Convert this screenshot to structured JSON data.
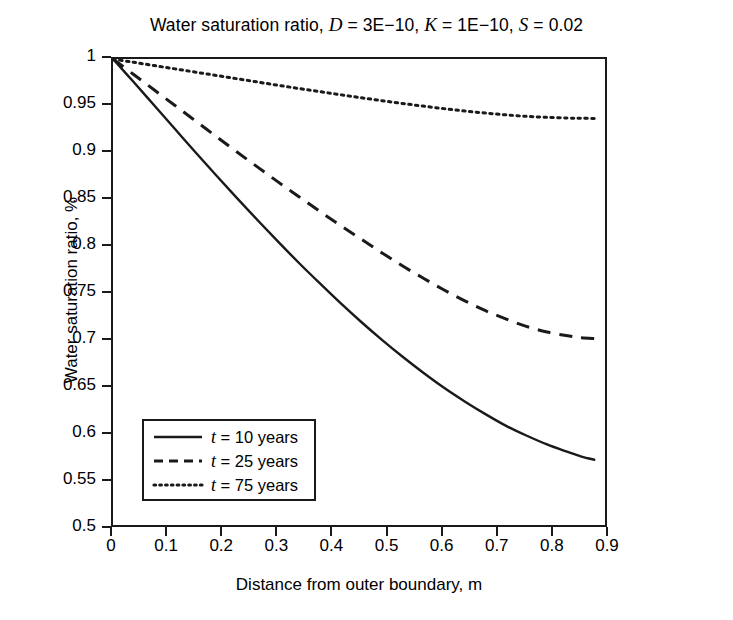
{
  "chart_data": {
    "type": "line",
    "title": "Water saturation ratio, D = 3E−10, K = 1E−10, S = 0.02",
    "title_parts": {
      "prefix": "Water saturation ratio, ",
      "d_symbol": "D",
      "d_value": " = 3E−10, ",
      "k_symbol": "K",
      "k_value": " = 1E−10, ",
      "s_symbol": "S",
      "s_value": " = 0.02"
    },
    "xlabel": "Distance from outer boundary, m",
    "ylabel": "Water saturation ratio, %",
    "xlim": [
      0,
      0.9
    ],
    "ylim": [
      0.5,
      1
    ],
    "grid": false,
    "legend_position": "lower-left-inside",
    "xticks": [
      0,
      0.1,
      0.2,
      0.3,
      0.4,
      0.5,
      0.6,
      0.7,
      0.8,
      0.9
    ],
    "xticklabels": [
      "0",
      "0.1",
      "0.2",
      "0.3",
      "0.4",
      "0.5",
      "0.6",
      "0.7",
      "0.8",
      "0.9"
    ],
    "yticks": [
      0.5,
      0.55,
      0.6,
      0.65,
      0.7,
      0.75,
      0.8,
      0.85,
      0.9,
      0.95,
      1
    ],
    "yticklabels": [
      "0.5",
      "0.55",
      "0.6",
      "0.65",
      "0.7",
      "0.75",
      "0.8",
      "0.85",
      "0.9",
      "0.95",
      "1"
    ],
    "x": [
      0,
      0.0375,
      0.075,
      0.1125,
      0.15,
      0.1875,
      0.225,
      0.2625,
      0.3,
      0.3375,
      0.375,
      0.4125,
      0.45,
      0.4875,
      0.525,
      0.5625,
      0.6,
      0.6375,
      0.675,
      0.7125,
      0.75,
      0.7875,
      0.825,
      0.85,
      0.875
    ],
    "series": [
      {
        "name": "t = 10 years",
        "label_symbol": "t",
        "label_rest": " = 10 years",
        "linestyle": "solid",
        "color": "#1a1a1a",
        "values": [
          1,
          0.9755,
          0.9505,
          0.9255,
          0.9005,
          0.876,
          0.852,
          0.8285,
          0.8055,
          0.783,
          0.7615,
          0.7405,
          0.7205,
          0.7015,
          0.6835,
          0.6665,
          0.6505,
          0.636,
          0.6225,
          0.61,
          0.5995,
          0.59,
          0.582,
          0.577,
          0.5735
        ]
      },
      {
        "name": "t = 25 years",
        "label_symbol": "t",
        "label_rest": " = 25 years",
        "linestyle": "dashed",
        "color": "#1a1a1a",
        "values": [
          1,
          0.9835,
          0.967,
          0.9505,
          0.934,
          0.9175,
          0.901,
          0.885,
          0.869,
          0.8535,
          0.838,
          0.823,
          0.8085,
          0.794,
          0.78,
          0.767,
          0.7545,
          0.743,
          0.7325,
          0.7235,
          0.7155,
          0.7095,
          0.7055,
          0.7035,
          0.7025
        ]
      },
      {
        "name": "t = 75 years",
        "label_symbol": "t",
        "label_rest": " = 75 years",
        "linestyle": "dotted",
        "color": "#1a1a1a",
        "values": [
          1,
          0.9965,
          0.993,
          0.9895,
          0.986,
          0.9825,
          0.979,
          0.9755,
          0.972,
          0.9686,
          0.9653,
          0.962,
          0.9588,
          0.9557,
          0.9527,
          0.9499,
          0.9472,
          0.9447,
          0.9425,
          0.9406,
          0.939,
          0.9379,
          0.9372,
          0.9369,
          0.9368
        ]
      }
    ]
  },
  "colors": {
    "ink": "#1a1a1a",
    "background": "#ffffff"
  }
}
